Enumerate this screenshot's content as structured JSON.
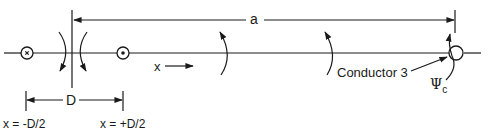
{
  "diagram": {
    "labels": {
      "distance_a": "a",
      "separation_D": "D",
      "x_axis": "x",
      "left_position": "x = -D/2",
      "right_position": "x = +D/2",
      "conductor_3": "Conductor 3",
      "psi_symbol": "Ψ",
      "psi_subscript": "c"
    },
    "elements": {
      "left_conductor": "current into page (×)",
      "right_conductor": "current out of page (•)",
      "conductor_3": "open circle on axis"
    },
    "colors": {
      "line": "#1a1a1a",
      "background": "#ffffff"
    }
  }
}
